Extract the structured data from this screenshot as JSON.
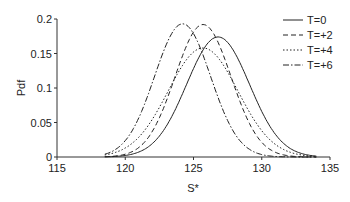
{
  "chart_data": {
    "type": "line",
    "title": "",
    "xlabel": "S*",
    "ylabel": "Pdf",
    "xlim": [
      115,
      135
    ],
    "ylim": [
      0,
      0.2
    ],
    "xticks": [
      "115",
      "120",
      "125",
      "130",
      "135"
    ],
    "yticks": [
      "0",
      "0.05",
      "0.1",
      "0.15",
      "0.2"
    ],
    "grid": false,
    "legend_position": "upper right",
    "series": [
      {
        "name": "T=0",
        "style": "solid",
        "peak_x": 126.8,
        "peak_y": 0.174,
        "sigma": 2.3
      },
      {
        "name": "T=+2",
        "style": "dashed",
        "peak_x": 125.7,
        "peak_y": 0.192,
        "sigma": 2.05
      },
      {
        "name": "T=+4",
        "style": "dotted",
        "peak_x": 125.7,
        "peak_y": 0.158,
        "sigma": 2.55
      },
      {
        "name": "T=+6",
        "style": "dashdot",
        "peak_x": 124.2,
        "peak_y": 0.193,
        "sigma": 2.05
      }
    ]
  }
}
